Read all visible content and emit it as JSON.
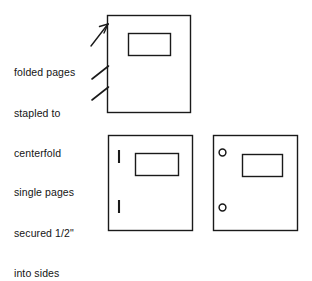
{
  "figure": {
    "background_color": "#ffffff",
    "ink_color": "#1a1a1a",
    "width": 312,
    "height": 247
  },
  "captions": {
    "folded": {
      "name": "folded-pages-caption",
      "lines": [
        "folded pages",
        "stapled to",
        "centerfold"
      ]
    },
    "single": {
      "name": "single-pages-caption",
      "lines": [
        "single pages",
        "secured 1/2\"",
        "into sides"
      ]
    }
  },
  "figures": [
    {
      "id": "top-page",
      "label": "folded pages stapled to centerfold",
      "page": {
        "x": 107,
        "y": 15,
        "width": 83,
        "height": 97
      },
      "inner_box": {
        "x": 128,
        "y": 33,
        "width": 42,
        "height": 22
      },
      "marks": {
        "type": "staple-ticks-outside-left",
        "arrow": {
          "x1": 92,
          "y1": 44,
          "x2": 108,
          "y2": 24
        },
        "ticks": [
          {
            "x1": 93,
            "y1": 78,
            "x2": 108,
            "y2": 66
          },
          {
            "x1": 93,
            "y1": 99,
            "x2": 108,
            "y2": 87
          }
        ]
      }
    },
    {
      "id": "bottom-left-page",
      "label": "single pages secured with staples",
      "page": {
        "x": 108,
        "y": 135,
        "width": 84,
        "height": 95
      },
      "inner_box": {
        "x": 135,
        "y": 153,
        "width": 43,
        "height": 22
      },
      "marks": {
        "type": "staple-bars-inside-left",
        "bars": [
          {
            "x": 118,
            "y": 150,
            "width": 2,
            "height": 13
          },
          {
            "x": 118,
            "y": 200,
            "width": 2,
            "height": 13
          }
        ]
      }
    },
    {
      "id": "bottom-right-page",
      "label": "single pages secured with punched holes",
      "page": {
        "x": 213,
        "y": 135,
        "width": 84,
        "height": 95
      },
      "inner_box": {
        "x": 242,
        "y": 154,
        "width": 40,
        "height": 22
      },
      "marks": {
        "type": "punched-holes-inside-left",
        "holes": [
          {
            "cx": 222,
            "cy": 152,
            "r": 3.6
          },
          {
            "cx": 222,
            "cy": 207,
            "r": 3.6
          }
        ]
      }
    }
  ],
  "colors": {
    "ink": "#1a1a1a",
    "paper": "#ffffff"
  }
}
